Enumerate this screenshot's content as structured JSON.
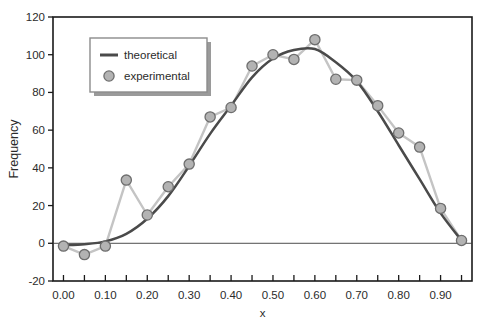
{
  "chart_data": {
    "type": "line",
    "title": "",
    "xlabel": "x",
    "ylabel": "Frequency",
    "xlim": [
      -0.025,
      0.975
    ],
    "ylim": [
      -20,
      120
    ],
    "ytick_values": [
      -20,
      0,
      20,
      40,
      60,
      80,
      100,
      120
    ],
    "ytick_labels": [
      "-20",
      "0",
      "20",
      "40",
      "60",
      "80",
      "100",
      "120"
    ],
    "xtick_values": [
      0.0,
      0.1,
      0.2,
      0.3,
      0.4,
      0.5,
      0.6,
      0.7,
      0.8,
      0.9
    ],
    "xtick_labels": [
      "0.00",
      "0.10",
      "0.20",
      "0.30",
      "0.40",
      "0.50",
      "0.60",
      "0.70",
      "0.80",
      "0.90"
    ],
    "xminor_step": 0.05,
    "grid": false,
    "zero_line": true,
    "legend_position": "upper-left-inside",
    "x": [
      0.0,
      0.05,
      0.1,
      0.15,
      0.2,
      0.25,
      0.3,
      0.35,
      0.4,
      0.45,
      0.5,
      0.55,
      0.6,
      0.65,
      0.7,
      0.75,
      0.8,
      0.85,
      0.9,
      0.95
    ],
    "series": [
      {
        "name": "theoretical",
        "style": "line",
        "color": "#4a4a4a",
        "values": [
          -1.0,
          -0.5,
          1.0,
          5.0,
          13.0,
          25.0,
          41.0,
          58.0,
          73.0,
          88.0,
          98.0,
          102.5,
          103.0,
          96.0,
          86.0,
          70.0,
          52.0,
          34.0,
          16.0,
          1.5
        ]
      },
      {
        "name": "experimental",
        "style": "line+marker",
        "color": "#c4c4c4",
        "marker_fill": "#b3b3b3",
        "marker_edge": "#6e6e6e",
        "values": [
          -1.5,
          -6.0,
          -1.5,
          33.5,
          15.0,
          30.0,
          42.0,
          67.0,
          72.0,
          94.0,
          100.0,
          97.5,
          108.0,
          87.0,
          86.5,
          73.0,
          58.5,
          51.0,
          18.5,
          1.5
        ]
      }
    ]
  },
  "legend": {
    "items": [
      {
        "label": "theoretical",
        "type": "line"
      },
      {
        "label": "experimental",
        "type": "marker"
      }
    ]
  },
  "colors": {
    "theoretical": "#4a4a4a",
    "experimental_line": "#c4c4c4",
    "marker_fill": "#b3b3b3",
    "marker_edge": "#6e6e6e",
    "axis": "#1a1a1a",
    "legend_border": "#8c8c8c",
    "legend_shadow": "#9a9a9a"
  },
  "caption": {
    "text": ""
  }
}
